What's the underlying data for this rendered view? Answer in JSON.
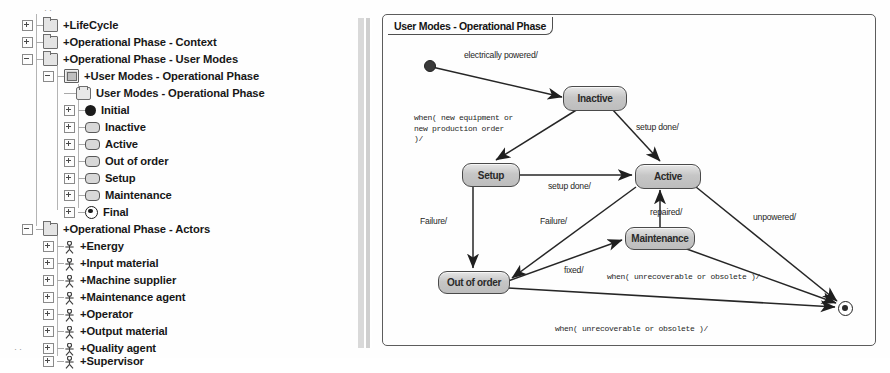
{
  "tree": {
    "name": "model-explorer",
    "nodes": [
      {
        "label": "+LifeCycle",
        "icon": "package-icon",
        "indent": 0,
        "expander": "plus",
        "y": 16
      },
      {
        "label": "+Operational Phase - Context",
        "icon": "package-icon",
        "indent": 0,
        "expander": "plus",
        "y": 33
      },
      {
        "label": "+Operational Phase - User Modes",
        "icon": "package-icon",
        "indent": 0,
        "expander": "minus",
        "y": 50
      },
      {
        "label": "+User Modes - Operational Phase",
        "icon": "statemachine-icon",
        "indent": 1,
        "expander": "minus",
        "y": 67
      },
      {
        "label": "User Modes - Operational Phase",
        "icon": "diagram-icon",
        "indent": 2,
        "expander": "none",
        "y": 84
      },
      {
        "label": "Initial",
        "icon": "initial-state-icon",
        "indent": 2,
        "expander": "plus",
        "y": 101
      },
      {
        "label": "Inactive",
        "icon": "state-icon",
        "indent": 2,
        "expander": "plus",
        "y": 118
      },
      {
        "label": "Active",
        "icon": "state-icon",
        "indent": 2,
        "expander": "plus",
        "y": 135
      },
      {
        "label": "Out of order",
        "icon": "state-icon",
        "indent": 2,
        "expander": "plus",
        "y": 152
      },
      {
        "label": "Setup",
        "icon": "state-icon",
        "indent": 2,
        "expander": "plus",
        "y": 169
      },
      {
        "label": "Maintenance",
        "icon": "state-icon",
        "indent": 2,
        "expander": "plus",
        "y": 186
      },
      {
        "label": "Final",
        "icon": "final-state-icon",
        "indent": 2,
        "expander": "plus",
        "y": 203
      },
      {
        "label": "+Operational Phase - Actors",
        "icon": "package-icon",
        "indent": 0,
        "expander": "minus",
        "y": 220
      },
      {
        "label": "+Energy",
        "icon": "actor-icon",
        "indent": 1,
        "expander": "plus",
        "y": 237
      },
      {
        "label": "+Input  material",
        "icon": "actor-icon",
        "indent": 1,
        "expander": "plus",
        "y": 254
      },
      {
        "label": "+Machine supplier",
        "icon": "actor-icon",
        "indent": 1,
        "expander": "plus",
        "y": 271
      },
      {
        "label": "+Maintenance agent",
        "icon": "actor-icon",
        "indent": 1,
        "expander": "plus",
        "y": 288
      },
      {
        "label": "+Operator",
        "icon": "actor-icon",
        "indent": 1,
        "expander": "plus",
        "y": 305
      },
      {
        "label": "+Output material",
        "icon": "actor-icon",
        "indent": 1,
        "expander": "plus",
        "y": 322
      },
      {
        "label": "+Quality agent",
        "icon": "actor-icon",
        "indent": 1,
        "expander": "plus",
        "y": 339
      },
      {
        "label": "+Supervisor",
        "icon": "actor-icon",
        "indent": 1,
        "expander": "plus",
        "y": 352
      }
    ]
  },
  "diagram": {
    "title": "User Modes - Operational Phase",
    "states": [
      {
        "id": "inactive",
        "label": "Inactive",
        "x": 223,
        "y": 86,
        "w": 62,
        "h": 23
      },
      {
        "id": "setup",
        "label": "Setup",
        "x": 122,
        "y": 163,
        "w": 56,
        "h": 22
      },
      {
        "id": "active",
        "label": "Active",
        "x": 295,
        "y": 164,
        "w": 64,
        "h": 23
      },
      {
        "id": "maintenance",
        "label": "Maintenance",
        "x": 285,
        "y": 227,
        "w": 68,
        "h": 21
      },
      {
        "id": "outoforder",
        "label": "Out of order",
        "x": 98,
        "y": 271,
        "w": 70,
        "h": 21
      }
    ],
    "pseudostates": [
      {
        "id": "initial",
        "kind": "initial-state",
        "x": 84,
        "y": 60
      },
      {
        "id": "final",
        "kind": "final-state",
        "x": 498,
        "y": 301
      }
    ],
    "transitions": [
      {
        "id": "initial-to-inactive",
        "label": "electrically powered/",
        "from": "initial",
        "to": "inactive"
      },
      {
        "id": "inactive-to-setup",
        "label": "when( new equipment or\nnew production order\n)/",
        "from": "inactive",
        "to": "setup",
        "mono": true
      },
      {
        "id": "inactive-to-active",
        "label": "setup done/",
        "from": "inactive",
        "to": "active"
      },
      {
        "id": "setup-to-active",
        "label": "setup done/",
        "from": "setup",
        "to": "active"
      },
      {
        "id": "setup-to-outoforder",
        "label": "Failure/",
        "from": "setup",
        "to": "outoforder"
      },
      {
        "id": "active-to-outoforder",
        "label": "Failure/",
        "from": "active",
        "to": "outoforder"
      },
      {
        "id": "maintenance-to-active",
        "label": "repaired/",
        "from": "maintenance",
        "to": "active"
      },
      {
        "id": "outoforder-to-maintenance",
        "label": "fixed/",
        "from": "outoforder",
        "to": "maintenance"
      },
      {
        "id": "active-to-final",
        "label": "unpowered/",
        "from": "active",
        "to": "final"
      },
      {
        "id": "maintenance-to-final",
        "label": "when( unrecoverable or obsolete )/",
        "from": "maintenance",
        "to": "final",
        "mono": true
      },
      {
        "id": "outoforder-to-final",
        "label": "when( unrecoverable or obsolete )/",
        "from": "outoforder",
        "to": "final",
        "mono": true
      }
    ],
    "labels": {
      "electrically_powered": "electrically powered/",
      "when_new_equipment": "when( new equipment or\nnew production order\n)/",
      "setup_done_top": "setup done/",
      "setup_done_mid": "setup done/",
      "failure_left": "Failure/",
      "failure_mid": "Failure/",
      "repaired": "repaired/",
      "fixed": "fixed/",
      "unpowered": "unpowered/",
      "when_unrecoverable_mid": "when( unrecoverable or obsolete )/",
      "when_unrecoverable_bottom": "when( unrecoverable or obsolete )/"
    }
  },
  "colors": {
    "state_fill": "#c6c6c6",
    "state_border": "#4a4a4a",
    "frame_border": "#5c5c5c",
    "edge": "#262626",
    "text": "#1a1a1a"
  }
}
